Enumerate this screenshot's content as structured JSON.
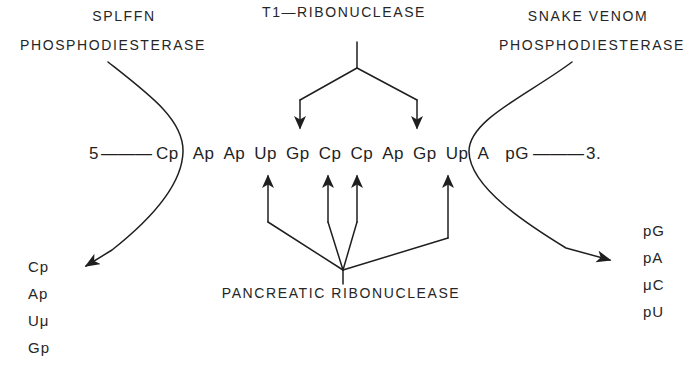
{
  "figure": {
    "background_color": "#ffffff",
    "ink_color": "#1f1f1f"
  },
  "enzymes": {
    "spleen": {
      "line1": "SPLFFN",
      "line2": "PHOSPHODIESTERASE"
    },
    "t1": {
      "line1": "T1—RIBONUCLEASE"
    },
    "snake_venom": {
      "line1": "SNAKE VENOM",
      "line2": "PHOSPHODIESTERASE"
    },
    "pancreatic": {
      "line1": "PANCREATIC RIBONUCLEASE"
    }
  },
  "sequence": {
    "five_prime": "5",
    "left_dashes": "———",
    "right_dashes": "———",
    "three_prime": "3.",
    "residues": [
      "Cp",
      "Ap",
      "Ap",
      "Up",
      "Gp",
      "Cp",
      "Cp",
      "Ap",
      "Gp",
      "Up",
      "A",
      "pG"
    ]
  },
  "products": {
    "spleen_products": [
      "Cp",
      "Ap",
      "Uμ",
      "Gp"
    ],
    "venom_products": [
      "pG",
      "pA",
      "μC",
      "pU"
    ]
  }
}
